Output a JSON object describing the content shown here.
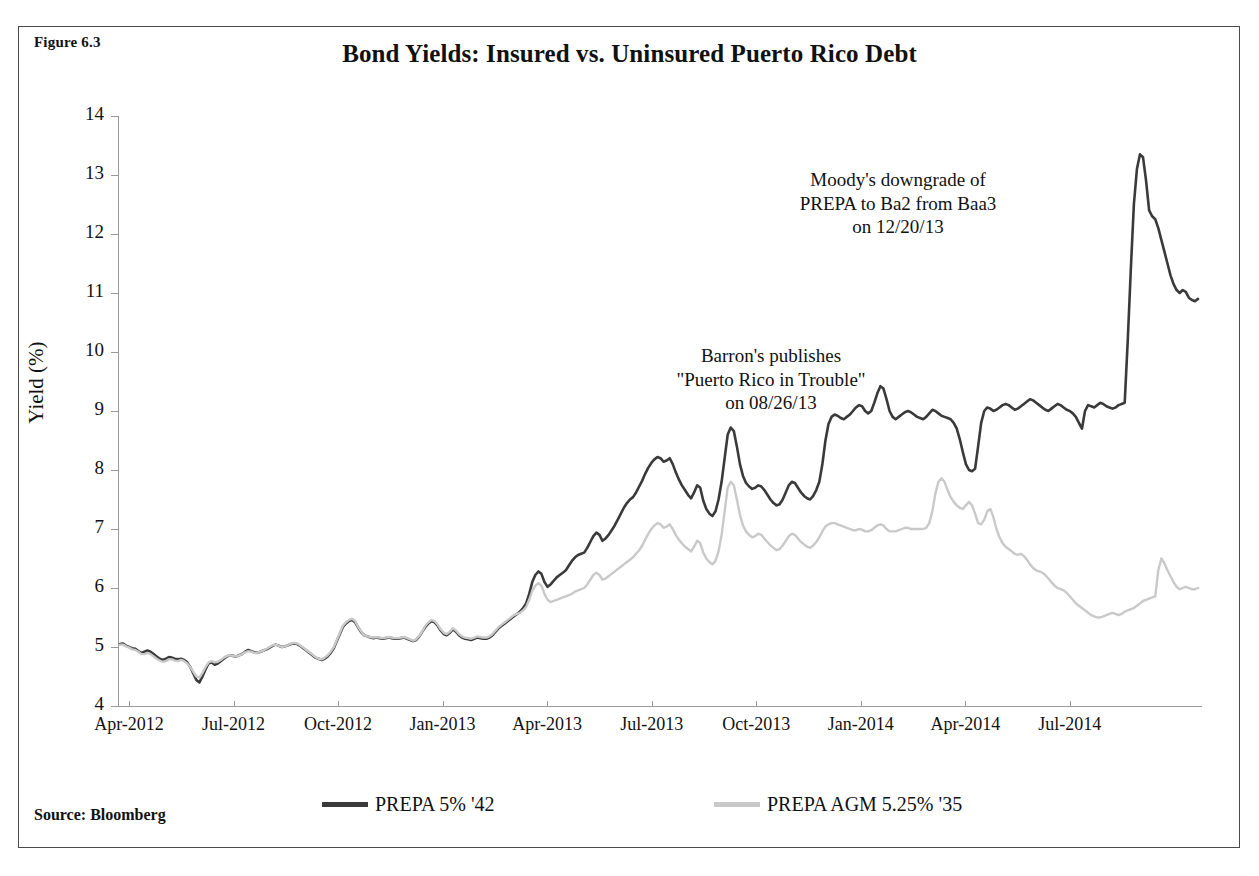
{
  "figure": {
    "label": "Figure 6.3",
    "title": "Bond Yields: Insured vs. Uninsured Puerto Rico Debt",
    "source_note": "Source: Bloomberg"
  },
  "colors": {
    "series_uninsured": "#3a3a3a",
    "series_insured": "#c9c9c9",
    "axis": "#9a9a9a",
    "border": "#4a4a4a",
    "text": "#111111"
  },
  "annotations": [
    {
      "id": "moodys",
      "text": "Moody's downgrade of\nPREPA  to Ba2 from Baa3\non 12/20/13"
    },
    {
      "id": "barrons",
      "text": "Barron's publishes\n\"Puerto Rico in Trouble\"\non 08/26/13"
    }
  ],
  "legend": {
    "items": [
      {
        "label": "PREPA 5% '42",
        "color": "#3a3a3a"
      },
      {
        "label": "PREPA AGM 5.25% '35",
        "color": "#c9c9c9"
      }
    ]
  },
  "chart_data": {
    "type": "line",
    "title": "Bond Yields: Insured vs. Uninsured Puerto Rico Debt",
    "xlabel": "",
    "ylabel": "Yield (%)",
    "ylim": [
      4,
      14
    ],
    "yticks": [
      4,
      5,
      6,
      7,
      8,
      9,
      10,
      11,
      12,
      13,
      14
    ],
    "xtick_labels": [
      "Apr-2012",
      "Jul-2012",
      "Oct-2012",
      "Jan-2013",
      "Apr-2013",
      "Jul-2013",
      "Oct-2013",
      "Jan-2014",
      "Apr-2014",
      "Jul-2014"
    ],
    "xlim": [
      "Apr-2012",
      "Aug-2014"
    ],
    "grid": false,
    "legend_position": "bottom",
    "x_units": "months since Apr-2012 (0 = Apr-2012, 28 = Aug-2014)",
    "series": [
      {
        "name": "PREPA 5% '42",
        "color": "#3a3a3a",
        "values": [
          5.05,
          5.06,
          5.02,
          5.0,
          4.98,
          4.97,
          4.93,
          4.9,
          4.92,
          4.94,
          4.92,
          4.88,
          4.84,
          4.8,
          4.78,
          4.8,
          4.83,
          4.82,
          4.8,
          4.79,
          4.8,
          4.78,
          4.74,
          4.66,
          4.55,
          4.44,
          4.4,
          4.5,
          4.62,
          4.72,
          4.74,
          4.7,
          4.72,
          4.76,
          4.8,
          4.84,
          4.86,
          4.85,
          4.84,
          4.86,
          4.88,
          4.92,
          4.95,
          4.93,
          4.91,
          4.9,
          4.92,
          4.94,
          4.96,
          4.99,
          5.02,
          5.04,
          5.02,
          5.0,
          5.01,
          5.03,
          5.05,
          5.06,
          5.05,
          5.02,
          4.98,
          4.94,
          4.9,
          4.86,
          4.82,
          4.8,
          4.78,
          4.8,
          4.84,
          4.9,
          4.98,
          5.1,
          5.22,
          5.34,
          5.4,
          5.44,
          5.46,
          5.42,
          5.33,
          5.25,
          5.2,
          5.18,
          5.16,
          5.15,
          5.16,
          5.15,
          5.14,
          5.15,
          5.16,
          5.15,
          5.14,
          5.14,
          5.15,
          5.16,
          5.14,
          5.12,
          5.1,
          5.12,
          5.18,
          5.26,
          5.34,
          5.4,
          5.44,
          5.42,
          5.36,
          5.28,
          5.22,
          5.2,
          5.24,
          5.3,
          5.26,
          5.2,
          5.16,
          5.14,
          5.13,
          5.12,
          5.14,
          5.16,
          5.15,
          5.14,
          5.14,
          5.16,
          5.2,
          5.26,
          5.32,
          5.36,
          5.4,
          5.44,
          5.48,
          5.52,
          5.56,
          5.6,
          5.66,
          5.74,
          5.9,
          6.1,
          6.22,
          6.28,
          6.24,
          6.1,
          6.02,
          6.06,
          6.12,
          6.18,
          6.22,
          6.26,
          6.3,
          6.38,
          6.46,
          6.52,
          6.56,
          6.58,
          6.6,
          6.68,
          6.78,
          6.88,
          6.94,
          6.9,
          6.8,
          6.84,
          6.9,
          6.98,
          7.06,
          7.16,
          7.26,
          7.36,
          7.44,
          7.5,
          7.54,
          7.62,
          7.72,
          7.82,
          7.94,
          8.04,
          8.12,
          8.18,
          8.22,
          8.2,
          8.14,
          8.16,
          8.2,
          8.1,
          7.96,
          7.84,
          7.74,
          7.66,
          7.58,
          7.52,
          7.62,
          7.74,
          7.7,
          7.48,
          7.34,
          7.26,
          7.22,
          7.3,
          7.5,
          7.8,
          8.2,
          8.6,
          8.72,
          8.66,
          8.4,
          8.1,
          7.9,
          7.78,
          7.72,
          7.68,
          7.7,
          7.74,
          7.72,
          7.66,
          7.58,
          7.5,
          7.44,
          7.4,
          7.42,
          7.5,
          7.62,
          7.74,
          7.8,
          7.78,
          7.7,
          7.62,
          7.56,
          7.52,
          7.5,
          7.56,
          7.66,
          7.8,
          8.1,
          8.5,
          8.78,
          8.9,
          8.94,
          8.92,
          8.88,
          8.86,
          8.9,
          8.94,
          9.0,
          9.06,
          9.1,
          9.08,
          9.0,
          8.96,
          9.0,
          9.14,
          9.3,
          9.42,
          9.38,
          9.2,
          9.0,
          8.9,
          8.86,
          8.9,
          8.94,
          8.98,
          9.0,
          8.98,
          8.94,
          8.9,
          8.88,
          8.86,
          8.9,
          8.96,
          9.02,
          9.0,
          8.96,
          8.92,
          8.9,
          8.88,
          8.86,
          8.8,
          8.7,
          8.52,
          8.3,
          8.1,
          8.0,
          7.98,
          8.02,
          8.4,
          8.8,
          9.0,
          9.06,
          9.04,
          9.0,
          9.02,
          9.06,
          9.1,
          9.12,
          9.1,
          9.06,
          9.02,
          9.04,
          9.08,
          9.12,
          9.16,
          9.2,
          9.18,
          9.14,
          9.1,
          9.06,
          9.02,
          9.0,
          9.04,
          9.08,
          9.12,
          9.1,
          9.06,
          9.02,
          9.0,
          8.96,
          8.9,
          8.8,
          8.7,
          9.0,
          9.1,
          9.08,
          9.06,
          9.1,
          9.14,
          9.12,
          9.08,
          9.06,
          9.04,
          9.06,
          9.1,
          9.12,
          9.14,
          10.2,
          11.4,
          12.5,
          13.1,
          13.35,
          13.3,
          12.9,
          12.4,
          12.3,
          12.25,
          12.1,
          11.9,
          11.7,
          11.5,
          11.3,
          11.15,
          11.05,
          11.0,
          11.05,
          11.02,
          10.92,
          10.88,
          10.86,
          10.9
        ]
      },
      {
        "name": "PREPA AGM 5.25% '35",
        "color": "#c9c9c9",
        "values": [
          5.04,
          5.04,
          5.01,
          4.99,
          4.96,
          4.95,
          4.92,
          4.88,
          4.88,
          4.9,
          4.88,
          4.84,
          4.8,
          4.77,
          4.75,
          4.76,
          4.79,
          4.79,
          4.77,
          4.76,
          4.78,
          4.76,
          4.72,
          4.66,
          4.58,
          4.5,
          4.48,
          4.56,
          4.66,
          4.74,
          4.76,
          4.74,
          4.75,
          4.78,
          4.82,
          4.85,
          4.86,
          4.85,
          4.84,
          4.86,
          4.88,
          4.91,
          4.93,
          4.92,
          4.9,
          4.9,
          4.92,
          4.94,
          4.97,
          5.0,
          5.03,
          5.04,
          5.02,
          5.0,
          5.01,
          5.03,
          5.06,
          5.07,
          5.06,
          5.03,
          4.99,
          4.95,
          4.91,
          4.87,
          4.83,
          4.8,
          4.79,
          4.82,
          4.86,
          4.92,
          5.0,
          5.12,
          5.24,
          5.36,
          5.42,
          5.46,
          5.48,
          5.44,
          5.34,
          5.26,
          5.2,
          5.18,
          5.17,
          5.16,
          5.17,
          5.16,
          5.15,
          5.16,
          5.17,
          5.16,
          5.15,
          5.15,
          5.16,
          5.17,
          5.15,
          5.13,
          5.11,
          5.13,
          5.19,
          5.27,
          5.36,
          5.42,
          5.46,
          5.44,
          5.38,
          5.3,
          5.24,
          5.22,
          5.26,
          5.32,
          5.28,
          5.22,
          5.18,
          5.16,
          5.15,
          5.14,
          5.16,
          5.18,
          5.17,
          5.16,
          5.16,
          5.18,
          5.22,
          5.28,
          5.34,
          5.38,
          5.42,
          5.46,
          5.5,
          5.54,
          5.56,
          5.58,
          5.62,
          5.68,
          5.8,
          5.95,
          6.04,
          6.08,
          6.04,
          5.9,
          5.8,
          5.76,
          5.78,
          5.8,
          5.82,
          5.84,
          5.86,
          5.88,
          5.9,
          5.94,
          5.96,
          5.98,
          6.0,
          6.06,
          6.14,
          6.22,
          6.26,
          6.22,
          6.14,
          6.16,
          6.2,
          6.24,
          6.28,
          6.32,
          6.36,
          6.4,
          6.44,
          6.48,
          6.52,
          6.58,
          6.64,
          6.72,
          6.82,
          6.92,
          7.0,
          7.06,
          7.1,
          7.08,
          7.02,
          7.04,
          7.08,
          7.0,
          6.9,
          6.82,
          6.76,
          6.7,
          6.66,
          6.62,
          6.7,
          6.8,
          6.76,
          6.6,
          6.5,
          6.44,
          6.4,
          6.46,
          6.62,
          6.9,
          7.3,
          7.7,
          7.8,
          7.74,
          7.5,
          7.24,
          7.06,
          6.96,
          6.9,
          6.86,
          6.88,
          6.92,
          6.9,
          6.84,
          6.78,
          6.72,
          6.68,
          6.64,
          6.66,
          6.72,
          6.8,
          6.88,
          6.92,
          6.9,
          6.84,
          6.78,
          6.74,
          6.7,
          6.68,
          6.72,
          6.78,
          6.86,
          6.96,
          7.04,
          7.08,
          7.1,
          7.1,
          7.08,
          7.06,
          7.04,
          7.02,
          7.0,
          6.98,
          6.98,
          7.0,
          6.99,
          6.96,
          6.96,
          6.98,
          7.02,
          7.06,
          7.08,
          7.06,
          7.0,
          6.96,
          6.96,
          6.96,
          6.98,
          7.0,
          7.02,
          7.02,
          7.0,
          7.0,
          7.0,
          7.0,
          7.0,
          7.02,
          7.1,
          7.3,
          7.6,
          7.8,
          7.86,
          7.8,
          7.66,
          7.54,
          7.46,
          7.4,
          7.36,
          7.34,
          7.4,
          7.46,
          7.4,
          7.26,
          7.1,
          7.08,
          7.16,
          7.3,
          7.34,
          7.2,
          7.0,
          6.86,
          6.76,
          6.7,
          6.66,
          6.62,
          6.58,
          6.56,
          6.58,
          6.54,
          6.48,
          6.4,
          6.34,
          6.3,
          6.28,
          6.26,
          6.22,
          6.16,
          6.1,
          6.04,
          6.0,
          5.98,
          5.96,
          5.92,
          5.86,
          5.8,
          5.74,
          5.7,
          5.66,
          5.62,
          5.58,
          5.54,
          5.52,
          5.5,
          5.5,
          5.52,
          5.54,
          5.56,
          5.58,
          5.56,
          5.54,
          5.56,
          5.6,
          5.62,
          5.64,
          5.66,
          5.7,
          5.74,
          5.78,
          5.8,
          5.82,
          5.84,
          5.86,
          6.3,
          6.5,
          6.42,
          6.3,
          6.2,
          6.1,
          6.02,
          5.98,
          6.0,
          6.02,
          6.0,
          5.98,
          5.98,
          6.0
        ]
      }
    ]
  }
}
